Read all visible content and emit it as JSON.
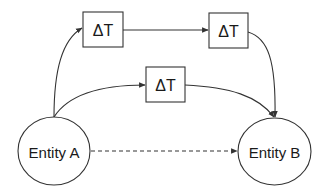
{
  "diagram": {
    "type": "flow",
    "colors": {
      "stroke": "#333333",
      "text": "#1a1a1a",
      "background": "#ffffff"
    },
    "nodes": {
      "entity_a": {
        "label": "Entity A",
        "shape": "ellipse"
      },
      "entity_b": {
        "label": "Entity B",
        "shape": "ellipse"
      },
      "delay_top_left": {
        "label": "ΔT",
        "shape": "rect"
      },
      "delay_top_right": {
        "label": "ΔT",
        "shape": "rect"
      },
      "delay_middle": {
        "label": "ΔT",
        "shape": "rect"
      }
    },
    "edges": [
      {
        "from": "entity_a",
        "to": "delay_top_left",
        "style": "solid",
        "arrow": true
      },
      {
        "from": "delay_top_left",
        "to": "delay_top_right",
        "style": "solid",
        "arrow": true
      },
      {
        "from": "delay_top_right",
        "to": "entity_b",
        "style": "solid",
        "arrow": true
      },
      {
        "from": "entity_a",
        "to": "delay_middle",
        "style": "solid",
        "arrow": true
      },
      {
        "from": "delay_middle",
        "to": "entity_b",
        "style": "solid",
        "arrow": true
      },
      {
        "from": "entity_a",
        "to": "entity_b",
        "style": "dashed",
        "arrow": true
      }
    ]
  }
}
